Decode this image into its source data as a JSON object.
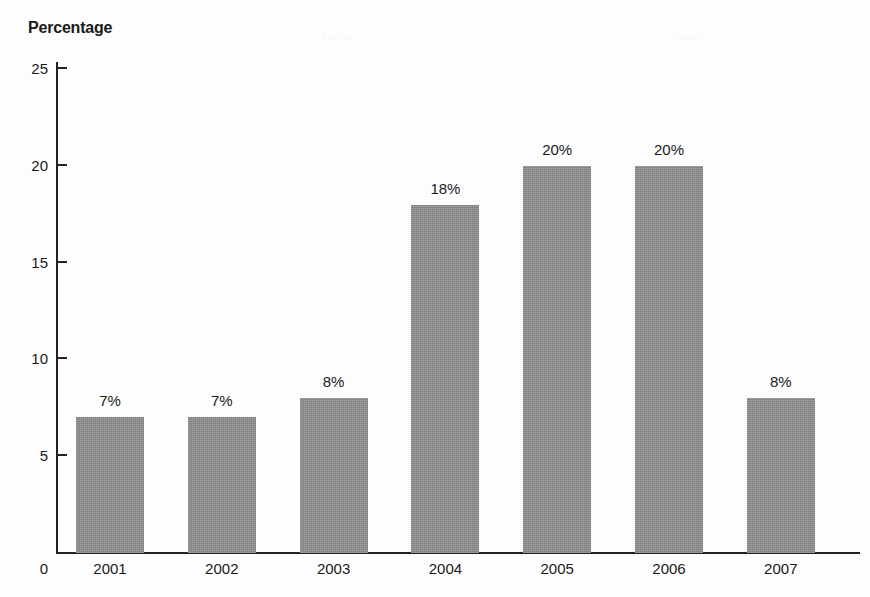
{
  "chart_data": {
    "type": "bar",
    "title": "Percentage",
    "xlabel": "",
    "ylabel": "Percentage",
    "categories": [
      "2001",
      "2002",
      "2003",
      "2004",
      "2005",
      "2006",
      "2007"
    ],
    "values": [
      7,
      7,
      8,
      18,
      20,
      20,
      8
    ],
    "data_labels": [
      "7%",
      "7%",
      "8%",
      "18%",
      "20%",
      "20%",
      "8%"
    ],
    "ylim": [
      0,
      25
    ],
    "ytick_labels": [
      "0",
      "5",
      "10",
      "15",
      "20",
      "25"
    ],
    "ytick_values": [
      0,
      5,
      10,
      15,
      20,
      25
    ],
    "grid": false,
    "legend": null,
    "legend_position": "none",
    "bar_color": "#8b8b8b",
    "axis_color": "#222222",
    "text_color": "#1a1a1a",
    "background_color": "#fdfdfd"
  },
  "artifacts": {
    "bleed_left": "......",
    "bleed_right": "....."
  }
}
